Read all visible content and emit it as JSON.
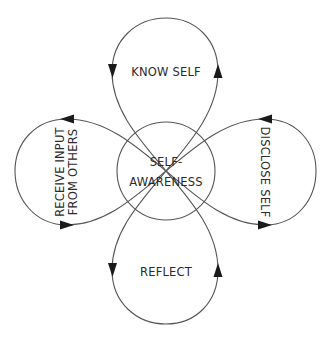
{
  "diagram": {
    "center": {
      "line1": "SELF-",
      "line2": "AWARENESS"
    },
    "loops": {
      "top": {
        "label": "KNOW SELF"
      },
      "right": {
        "label": "DISCLOSE SELF"
      },
      "bottom": {
        "label": "REFLECT"
      },
      "left": {
        "line1": "RECEIVE INPUT",
        "line2": "FROM OTHERS"
      }
    },
    "colors": {
      "stroke": "#555555",
      "arrow": "#1a1a1a",
      "text": "#2b2b2b",
      "background": "#ffffff"
    }
  }
}
